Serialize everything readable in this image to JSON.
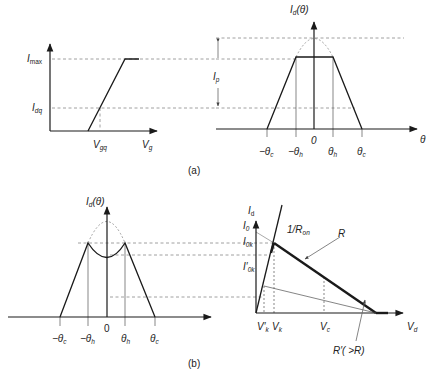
{
  "figure": {
    "panel_a": {
      "caption": "(a)",
      "transfer_plot": {
        "y_label_imax": "I",
        "y_label_imax_sub": "max",
        "y_label_idq": "I",
        "y_label_idq_sub": "dq",
        "x_label_vgq": "V",
        "x_label_vgq_sub": "gq",
        "x_label_vg": "V",
        "x_label_vg_sub": "g"
      },
      "waveform_plot": {
        "y_axis_label": "I",
        "y_axis_label_sub": "d",
        "y_axis_label_arg": "(θ)",
        "ip_label": "I",
        "ip_label_sub": "p",
        "x_axis_label": "θ",
        "ticks": [
          {
            "text": "−θ",
            "sub": "c"
          },
          {
            "text": "−θ",
            "sub": "h"
          },
          {
            "text": "0",
            "sub": ""
          },
          {
            "text": "θ",
            "sub": "h"
          },
          {
            "text": "θ",
            "sub": "c"
          }
        ]
      }
    },
    "panel_b": {
      "caption": "(b)",
      "waveform_plot": {
        "y_axis_label": "I",
        "y_axis_label_sub": "d",
        "y_axis_label_arg": "(θ)",
        "ticks": [
          {
            "text": "−θ",
            "sub": "c"
          },
          {
            "text": "−θ",
            "sub": "h"
          },
          {
            "text": "0",
            "sub": ""
          },
          {
            "text": "θ",
            "sub": "h"
          },
          {
            "text": "θ",
            "sub": "c"
          }
        ]
      },
      "iv_plot": {
        "y_axis_label": "I",
        "y_axis_label_sub": "d",
        "label_i0": "I",
        "label_i0_sub": "0",
        "label_i0k": "I",
        "label_i0k_sub": "0k",
        "label_i0k_prime": "I′",
        "label_i0k_prime_sub": "0k",
        "label_ron": "1/R",
        "label_ron_sub": "on",
        "label_r": "R",
        "label_rprime": "R′( >R)",
        "x_label_vk_prime": "V′",
        "x_label_vk_prime_sub": "k",
        "x_label_vk": "V",
        "x_label_vk_sub": "k",
        "x_label_vc": "V",
        "x_label_vc_sub": "c",
        "x_axis_label": "V",
        "x_axis_label_sub": "d"
      }
    }
  }
}
